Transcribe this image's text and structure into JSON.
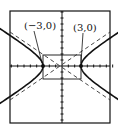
{
  "chart_data": {
    "type": "line",
    "title": "",
    "xlabel": "",
    "ylabel": "",
    "xlim": [
      -8,
      8
    ],
    "ylim": [
      -10,
      10
    ],
    "grid": false,
    "equation": "x^2/9 - y^2/4 = 1",
    "annotations": [
      {
        "text": "(−3,0)",
        "x": -3,
        "y": 0
      },
      {
        "text": "(3,0)",
        "x": 3,
        "y": 0
      }
    ],
    "vertices": [
      [
        -3,
        0
      ],
      [
        3,
        0
      ]
    ],
    "center": [
      0,
      0
    ],
    "central_rectangle": {
      "x": [
        -3,
        3
      ],
      "y": [
        -2,
        2
      ]
    },
    "asymptotes": [
      "y = 2x/3",
      "y = -2x/3"
    ],
    "series": [
      {
        "name": "hyperbola",
        "style": "solid"
      },
      {
        "name": "asymptotes",
        "style": "dashed"
      }
    ]
  },
  "labels": {
    "left_vertex": "(−3,0)",
    "right_vertex": "(3,0)"
  },
  "colors": {
    "ink": "#111111",
    "background": "#ffffff"
  }
}
